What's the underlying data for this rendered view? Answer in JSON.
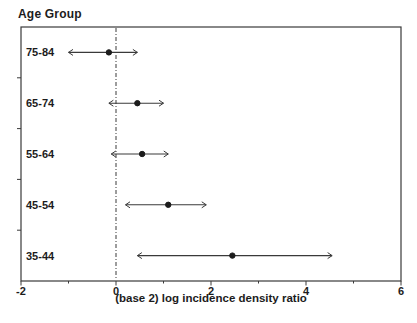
{
  "figure": {
    "group_axis_title": "Age Group",
    "x_axis_title": "(base 2) log incidence density ratio"
  },
  "chart_data": {
    "type": "scatter",
    "variant": "forest-plot",
    "title": "Age Group",
    "xlabel": "(base 2) log incidence density ratio",
    "ylabel": "Age Group",
    "categories": [
      "75-84",
      "65-74",
      "55-64",
      "45-54",
      "35-44"
    ],
    "series": [
      {
        "name": "log incidence density ratio by age group",
        "points": [
          {
            "category": "75-84",
            "estimate": -0.15,
            "ci_low": -1.0,
            "ci_high": 0.45
          },
          {
            "category": "65-74",
            "estimate": 0.45,
            "ci_low": -0.15,
            "ci_high": 1.0
          },
          {
            "category": "55-64",
            "estimate": 0.55,
            "ci_low": -0.1,
            "ci_high": 1.1
          },
          {
            "category": "45-54",
            "estimate": 1.1,
            "ci_low": 0.2,
            "ci_high": 1.9
          },
          {
            "category": "35-44",
            "estimate": 2.45,
            "ci_low": 0.45,
            "ci_high": 4.55
          }
        ]
      }
    ],
    "xlim": [
      -2,
      6
    ],
    "x_major_ticks": [
      -2,
      0,
      2,
      4,
      6
    ],
    "x_major_tick_labels": [
      "-2",
      "0",
      "2",
      "4",
      "6"
    ],
    "x_minor_ticks": [
      -1,
      1,
      3,
      5
    ],
    "reference_line_x": 0,
    "reference_line_style": "dash-dot",
    "ci_end_style": "arrow",
    "marker": "filled-circle",
    "grid": false,
    "legend": "none",
    "colors": {
      "ink": "#1c1c1c",
      "line": "#3a3a3a",
      "background": "#ffffff"
    }
  }
}
